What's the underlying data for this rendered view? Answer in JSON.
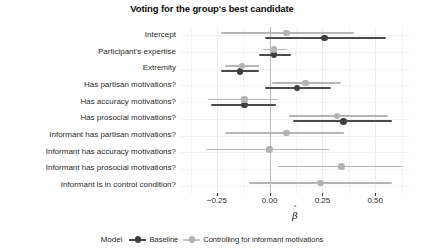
{
  "chart_data": {
    "type": "scatter",
    "title": "Voting for the group's best candidate",
    "xlabel": "β̂",
    "ylabel": "",
    "xlim": [
      -0.42,
      0.66
    ],
    "xticks": [
      -0.25,
      0.0,
      0.25,
      0.5
    ],
    "xticklabels": [
      "−0.25",
      "0.00",
      "0.25",
      "0.50"
    ],
    "grid": true,
    "legend": {
      "title": "Model",
      "position": "bottom",
      "entries": [
        {
          "name": "Baseline",
          "color": "#3f3f3f"
        },
        {
          "name": "Controlling for informant motivations",
          "color": "#b3b3b3"
        }
      ]
    },
    "categories": [
      "Intercept",
      "Participant's expertise",
      "Extremity",
      "Has partisan motivations?",
      "Has accuracy motivations?",
      "Has prosocial motivations?",
      "Informant has partisan motivations?",
      "Informant has accuracy motivations?",
      "Informant has prosocial motivations?",
      "Informant is in control condition?"
    ],
    "series": [
      {
        "name": "Baseline",
        "color": "#3f3f3f",
        "points": [
          {
            "category": "Intercept",
            "estimate": 0.26,
            "low": -0.02,
            "high": 0.55
          },
          {
            "category": "Participant's expertise",
            "estimate": 0.02,
            "low": -0.05,
            "high": 0.1
          },
          {
            "category": "Extremity",
            "estimate": -0.14,
            "low": -0.23,
            "high": -0.05
          },
          {
            "category": "Has partisan motivations?",
            "estimate": 0.13,
            "low": -0.02,
            "high": 0.29
          },
          {
            "category": "Has accuracy motivations?",
            "estimate": -0.12,
            "low": -0.28,
            "high": 0.03
          },
          {
            "category": "Has prosocial motivations?",
            "estimate": 0.35,
            "low": 0.11,
            "high": 0.58
          },
          {
            "category": "Informant has partisan motivations?",
            "estimate": null,
            "low": null,
            "high": null
          },
          {
            "category": "Informant has accuracy motivations?",
            "estimate": null,
            "low": null,
            "high": null
          },
          {
            "category": "Informant has prosocial motivations?",
            "estimate": null,
            "low": null,
            "high": null
          },
          {
            "category": "Informant is in control condition?",
            "estimate": null,
            "low": null,
            "high": null
          }
        ]
      },
      {
        "name": "Controlling for informant motivations",
        "color": "#b3b3b3",
        "points": [
          {
            "category": "Intercept",
            "estimate": 0.08,
            "low": -0.23,
            "high": 0.4
          },
          {
            "category": "Participant's expertise",
            "estimate": 0.02,
            "low": -0.03,
            "high": 0.08
          },
          {
            "category": "Extremity",
            "estimate": -0.13,
            "low": -0.21,
            "high": -0.05
          },
          {
            "category": "Has partisan motivations?",
            "estimate": 0.17,
            "low": 0.01,
            "high": 0.34
          },
          {
            "category": "Has accuracy motivations?",
            "estimate": -0.12,
            "low": -0.29,
            "high": 0.04
          },
          {
            "category": "Has prosocial motivations?",
            "estimate": 0.32,
            "low": 0.09,
            "high": 0.56
          },
          {
            "category": "Informant has partisan motivations?",
            "estimate": 0.08,
            "low": -0.21,
            "high": 0.35
          },
          {
            "category": "Informant has accuracy motivations?",
            "estimate": 0.0,
            "low": -0.3,
            "high": 0.28
          },
          {
            "category": "Informant has prosocial motivations?",
            "estimate": 0.34,
            "low": 0.04,
            "high": 0.63
          },
          {
            "category": "Informant is in control condition?",
            "estimate": 0.24,
            "low": -0.1,
            "high": 0.58
          }
        ]
      }
    ]
  }
}
